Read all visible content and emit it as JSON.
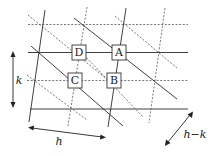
{
  "diagram": {
    "type": "lattice-planes",
    "points": [
      {
        "label": "A",
        "x": 117,
        "y": 52.5
      },
      {
        "label": "B",
        "x": 113,
        "y": 80.5
      },
      {
        "label": "C",
        "x": 75,
        "y": 80.5
      },
      {
        "label": "D",
        "x": 79,
        "y": 52.5
      }
    ],
    "dimensions": [
      {
        "label": "k",
        "description": "vertical spacing between solid horizontal lines"
      },
      {
        "label": "h",
        "description": "horizontal spacing between solid near-vertical lines"
      },
      {
        "label": "h−k",
        "description": "spacing between solid diagonal lines"
      }
    ],
    "colors": {
      "line": "#2a2a2a",
      "dashed": "#555555",
      "background": "#ffffff"
    }
  }
}
